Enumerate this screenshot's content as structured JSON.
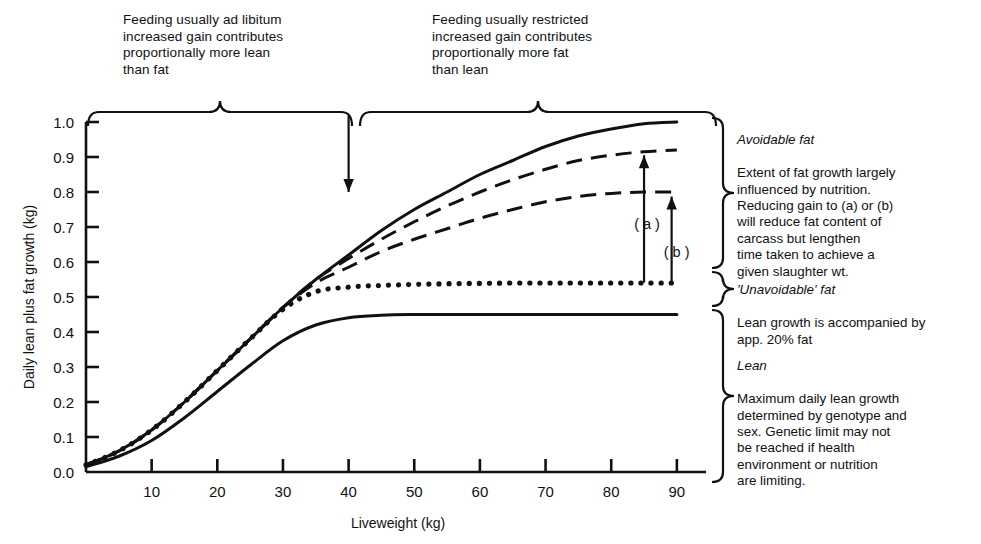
{
  "top_annotations": [
    {
      "id": "ad-libitum",
      "text": "Feeding usually ad libitum\nincreased gain contributes\nproportionally more lean\nthan fat"
    },
    {
      "id": "restricted",
      "text": "Feeding usually restricted\nincreased gain contributes\nproportionally more fat\nthan lean"
    }
  ],
  "side_annotations": [
    {
      "id": "avoidable-fat",
      "heading": "Avoidable fat",
      "body": "Extent of fat growth largely\ninfluenced by nutrition.\nReducing gain to (a) or (b)\nwill reduce fat content of\ncarcass but lengthen\ntime taken to achieve a\ngiven slaughter wt."
    },
    {
      "id": "unavoidable-fat",
      "heading": "'Unavoidable' fat",
      "body": "Lean growth is accompanied by\napp. 20% fat"
    },
    {
      "id": "lean",
      "heading": "Lean",
      "body": "Maximum daily lean growth\ndetermined by genotype and\nsex. Genetic limit may not\nbe reached if health\nenvironment or nutrition\nare limiting."
    }
  ],
  "curve_markers": [
    {
      "id": "marker-a",
      "label": "( a )"
    },
    {
      "id": "marker-b",
      "label": "( b )"
    }
  ],
  "chart_data": {
    "type": "line",
    "title": "",
    "xlabel": "Liveweight (kg)",
    "ylabel": "Daily lean plus fat growth (kg)",
    "xlim": [
      0,
      92
    ],
    "ylim": [
      0.0,
      1.0
    ],
    "grid": false,
    "legend": "none",
    "xticks": [
      10,
      20,
      30,
      40,
      50,
      60,
      70,
      80,
      90
    ],
    "xticklabels": [
      "10",
      "20",
      "30",
      "40",
      "50",
      "60",
      "70",
      "80",
      "90"
    ],
    "yticks": [
      0.0,
      0.1,
      0.2,
      0.3,
      0.4,
      0.5,
      0.6,
      0.7,
      0.8,
      0.9,
      1.0
    ],
    "yticklabels": [
      "0.0",
      "0.1",
      "0.2",
      "0.3",
      "0.4",
      "0.5",
      "0.6",
      "0.7",
      "0.8",
      "0.9",
      "1.0"
    ],
    "x": [
      0,
      5,
      10,
      15,
      20,
      25,
      30,
      35,
      40,
      45,
      50,
      55,
      60,
      65,
      70,
      75,
      80,
      85,
      90
    ],
    "series": [
      {
        "name": "Total lean plus fat growth (ad libitum)",
        "style": "solid",
        "values": [
          0.02,
          0.06,
          0.12,
          0.2,
          0.29,
          0.38,
          0.47,
          0.55,
          0.62,
          0.69,
          0.75,
          0.8,
          0.85,
          0.89,
          0.93,
          0.96,
          0.98,
          0.995,
          1.0
        ]
      },
      {
        "name": "Restricted gain (a)",
        "style": "dashed",
        "values": [
          0.02,
          0.06,
          0.12,
          0.2,
          0.29,
          0.38,
          0.47,
          0.55,
          0.61,
          0.665,
          0.715,
          0.76,
          0.8,
          0.835,
          0.865,
          0.89,
          0.905,
          0.915,
          0.92
        ]
      },
      {
        "name": "Restricted gain (b)",
        "style": "dashed",
        "values": [
          0.02,
          0.06,
          0.12,
          0.2,
          0.29,
          0.38,
          0.47,
          0.54,
          0.585,
          0.63,
          0.665,
          0.695,
          0.725,
          0.75,
          0.772,
          0.787,
          0.796,
          0.8,
          0.8
        ]
      },
      {
        "name": "'Unavoidable' fat boundary (lean + 20% fat)",
        "style": "dotted",
        "values": [
          0.02,
          0.06,
          0.12,
          0.2,
          0.29,
          0.38,
          0.465,
          0.515,
          0.528,
          0.533,
          0.536,
          0.538,
          0.539,
          0.54,
          0.54,
          0.54,
          0.54,
          0.54,
          0.54
        ]
      },
      {
        "name": "Lean",
        "style": "solid",
        "values": [
          0.015,
          0.045,
          0.09,
          0.155,
          0.23,
          0.305,
          0.375,
          0.42,
          0.441,
          0.448,
          0.45,
          0.45,
          0.45,
          0.45,
          0.45,
          0.45,
          0.45,
          0.45,
          0.45
        ]
      }
    ],
    "annotations": [
      {
        "id": "arrow-a",
        "label": "( a )",
        "x": 85,
        "y_from": 0.54,
        "y_to": 0.915
      },
      {
        "id": "arrow-b",
        "label": "( b )",
        "x": 89,
        "y_from": 0.54,
        "y_to": 0.8
      },
      {
        "id": "arrow-split",
        "x": 40,
        "y_from": 1.02,
        "y_to": 0.8
      }
    ]
  }
}
